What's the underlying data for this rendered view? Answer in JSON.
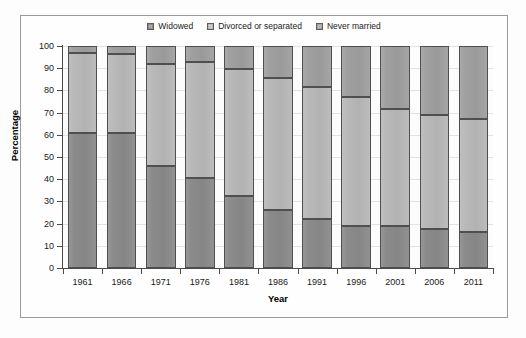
{
  "chart_data": {
    "type": "bar",
    "subtype": "stacked-percentage",
    "title": "",
    "xlabel": "Year",
    "ylabel": "Percentage",
    "ylim": [
      0,
      100
    ],
    "ytick_step": 10,
    "yticks": [
      0,
      10,
      20,
      30,
      40,
      50,
      60,
      70,
      80,
      90,
      100
    ],
    "categories": [
      "1961",
      "1966",
      "1971",
      "1976",
      "1981",
      "1986",
      "1991",
      "1996",
      "2001",
      "2006",
      "2011"
    ],
    "grid": true,
    "grid_axis": "y",
    "legend_position": "top-center",
    "series": [
      {
        "name": "Widowed",
        "color": "#8b8b8b",
        "values": [
          61.0,
          61.0,
          46.0,
          40.5,
          32.5,
          26.0,
          22.0,
          19.0,
          18.8,
          17.7,
          16.0
        ]
      },
      {
        "name": "Divorced or separated",
        "color": "#b9b9b9",
        "values": [
          36.0,
          35.5,
          46.0,
          52.5,
          57.0,
          59.5,
          59.5,
          58.0,
          52.7,
          51.3,
          51.0
        ]
      },
      {
        "name": "Never married",
        "color": "#a0a0a0",
        "values": [
          3.0,
          3.5,
          8.0,
          7.0,
          10.5,
          14.5,
          18.5,
          23.0,
          28.5,
          31.0,
          33.0
        ]
      }
    ],
    "cumulative_tops": {
      "widowed": [
        61.0,
        61.0,
        46.0,
        40.5,
        32.5,
        26.0,
        22.0,
        19.0,
        18.8,
        17.7,
        16.0
      ],
      "widowed_plus_divorced": [
        97.0,
        96.5,
        92.0,
        93.0,
        89.5,
        85.5,
        81.5,
        77.0,
        71.5,
        69.0,
        67.0
      ],
      "total": [
        100.0,
        100.0,
        100.0,
        100.0,
        100.0,
        100.0,
        100.0,
        100.0,
        100.0,
        100.0,
        100.0
      ]
    }
  },
  "legend": {
    "entries": [
      {
        "label": "Widowed",
        "color": "#8b8b8b"
      },
      {
        "label": "Divorced or separated",
        "color": "#b9b9b9"
      },
      {
        "label": "Never married",
        "color": "#a0a0a0"
      }
    ]
  },
  "axes": {
    "y_title": "Percentage",
    "x_title": "Year",
    "y_tick_labels": [
      "100",
      "90",
      "80",
      "70",
      "60",
      "50",
      "40",
      "30",
      "20",
      "10",
      "0"
    ],
    "x_tick_labels": [
      "1961",
      "1966",
      "1971",
      "1976",
      "1981",
      "1986",
      "1991",
      "1996",
      "2001",
      "2006",
      "2011"
    ]
  },
  "colors": {
    "frame": "#9a9a9a",
    "axis": "#4a4a4a",
    "grid": "#e2e2e2",
    "background": "#fdfdfd",
    "bar_outline": "#4f4f4f"
  }
}
